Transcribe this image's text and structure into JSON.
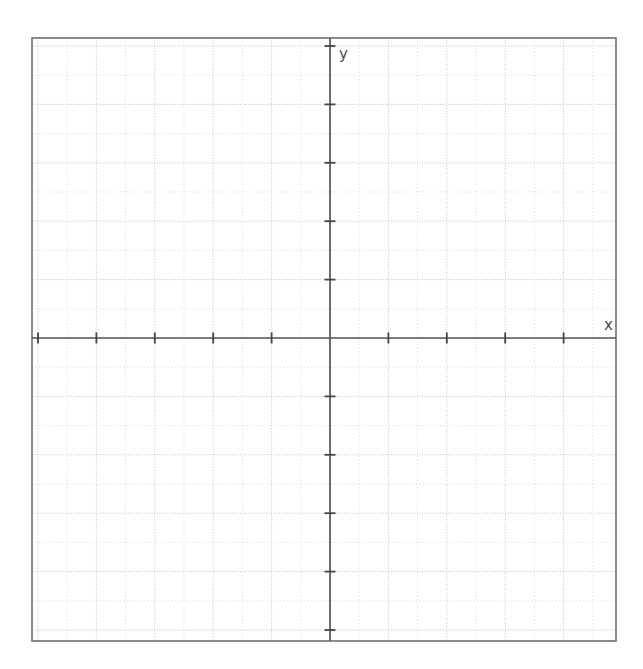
{
  "page": {
    "background_color": "#ffffff",
    "width": 643,
    "height": 669
  },
  "plot_frame": {
    "left": 32,
    "top": 38,
    "right": 616,
    "bottom": 641,
    "border_color": "#6e6e6e",
    "border_width": 1.6,
    "fill_color": "#ffffff"
  },
  "grid": {
    "visible": true,
    "style": "dotted",
    "spacing_px": 29.2,
    "minor_color": "#d8d8d8",
    "major_color": "#c2c2c2",
    "columns": 20,
    "rows": 21
  },
  "axes": {
    "x_axis": {
      "label": "x",
      "label_x": 604,
      "label_y": 330,
      "position_y": 338,
      "color": "#555555",
      "width": 1.7,
      "tick_length": 11,
      "tick_spacing_px": 58.4,
      "tick_color": "#444444"
    },
    "y_axis": {
      "label": "y",
      "label_x": 339,
      "label_y": 59,
      "position_x": 330,
      "color": "#555555",
      "width": 1.7,
      "tick_length": 11,
      "tick_spacing_px": 58.4,
      "tick_color": "#444444"
    }
  },
  "chart_data": {
    "type": "line",
    "title": "",
    "subtitle": "",
    "xlabel": "x",
    "ylabel": "y",
    "series": [],
    "x": [],
    "values": [],
    "xlim": [
      -10.2,
      9.8
    ],
    "ylim": [
      -10.4,
      10.3
    ],
    "x_major_tick_interval": 2,
    "y_major_tick_interval": 2,
    "x_minor_tick_interval": 1,
    "y_minor_tick_interval": 1,
    "x_tick_labels": [],
    "y_tick_labels": [],
    "grid": true,
    "legend": false,
    "legend_position": "none",
    "annotations": [],
    "note": "Empty coordinate plane; no data plotted. Axes intersect at origin located at pixel (330, 338)."
  }
}
